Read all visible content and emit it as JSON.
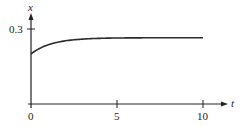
{
  "chart_data": {
    "type": "line",
    "title": "",
    "xlabel": "t",
    "ylabel": "x",
    "xlim": [
      0,
      11.5
    ],
    "ylim": [
      0,
      0.36
    ],
    "x_ticks": [
      0,
      5,
      10
    ],
    "x_tick_labels": [
      "0",
      "5",
      "10"
    ],
    "y_ticks": [
      0.3
    ],
    "y_tick_labels": [
      "0.3"
    ],
    "grid": false,
    "legend": null,
    "series": [
      {
        "name": "x(t)",
        "x": [
          0,
          0.5,
          1,
          1.5,
          2,
          2.5,
          3,
          4,
          5,
          6,
          7,
          8,
          9,
          10
        ],
        "values": [
          0.2,
          0.222,
          0.236,
          0.246,
          0.253,
          0.257,
          0.26,
          0.263,
          0.264,
          0.265,
          0.265,
          0.265,
          0.265,
          0.265
        ]
      }
    ],
    "model": {
      "asymptote": 0.265,
      "initial": 0.2,
      "tau": 1.2
    }
  },
  "axes": {
    "x_label": "t",
    "y_label": "x",
    "x_tick_0": "0",
    "x_tick_5": "5",
    "x_tick_10": "10",
    "y_tick_03": "0.3"
  },
  "colors": {
    "axis": "#222222",
    "curve": "#2a2a2a",
    "background": "#ffffff"
  }
}
